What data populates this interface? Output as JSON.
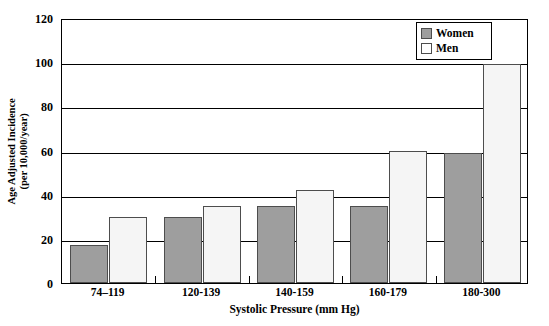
{
  "chart_data": {
    "type": "bar",
    "title": "",
    "subtitle": "",
    "xlabel": "Systolic Pressure (mm Hg)",
    "ylabel_line1": "Age Adjusted Incidence",
    "ylabel_line2": "(per 10,000/year)",
    "categories": [
      "74–119",
      "120-139",
      "140-159",
      "160-179",
      "180-300"
    ],
    "series": [
      {
        "name": "Women",
        "color": "#9e9e9e",
        "values": [
          17,
          30,
          35,
          35,
          59
        ]
      },
      {
        "name": "Men",
        "color": "#ffffff",
        "values": [
          30,
          35,
          42,
          60,
          99
        ]
      }
    ],
    "ylim": [
      0,
      120
    ],
    "yticks": [
      0,
      20,
      40,
      60,
      80,
      100,
      120
    ],
    "ytick_labels": [
      "0",
      "20",
      "40",
      "60",
      "80",
      "100",
      "120"
    ],
    "grid": "horizontal",
    "legend_position": "top-right",
    "legend_entries": [
      "Women",
      "Men"
    ]
  }
}
